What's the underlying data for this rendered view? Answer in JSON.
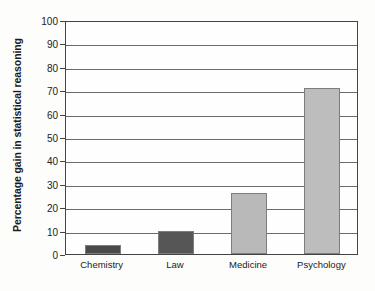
{
  "chart_data": {
    "type": "bar",
    "title": "",
    "subtitle": "",
    "xlabel": "",
    "ylabel": "Percentage gain in statistical reasoning",
    "categories": [
      "Chemistry",
      "Law",
      "Medicine",
      "Psychology"
    ],
    "values": [
      4,
      10,
      26,
      71
    ],
    "series": [
      {
        "name": "Percentage gain in statistical reasoning",
        "values": [
          4,
          10,
          26,
          71
        ]
      }
    ],
    "bar_colors": [
      "#4a4a4a",
      "#565656",
      "#b9b9b9",
      "#bdbdbd"
    ],
    "ylim": [
      0,
      100
    ],
    "ytick_labels": [
      "0",
      "10",
      "20",
      "30",
      "40",
      "50",
      "60",
      "70",
      "80",
      "90",
      "100"
    ],
    "ytick_values": [
      0,
      10,
      20,
      30,
      40,
      50,
      60,
      70,
      80,
      90,
      100
    ],
    "grid": true,
    "grid_axis": "y",
    "legend": false,
    "legend_position": "none",
    "axis_color": "#444444",
    "gridline_color": "#6a6a6a",
    "background_color": "#fdfdfc",
    "plot_background_color": "#fefefe"
  }
}
